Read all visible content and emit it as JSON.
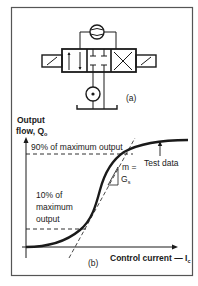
{
  "figure": {
    "panel_a": {
      "label": "(a)",
      "components": [
        "solenoid-left",
        "valve-body-3-position",
        "solenoid-right",
        "pressure-gauge",
        "pump",
        "tank"
      ]
    },
    "panel_b": {
      "label": "(b)",
      "y_axis_label_line1": "Output",
      "y_axis_label_line2": "flow, Q",
      "y_axis_label_sub": "o",
      "x_axis_label": "Control current — I",
      "x_axis_label_sub": "c",
      "annotation_90": "90% of maximum output",
      "annotation_10_line1": "10% of",
      "annotation_10_line2": "maximum",
      "annotation_10_line3": "output",
      "annotation_test_data": "Test data",
      "slope_line1": "m =",
      "slope_line2": "G",
      "slope_sub": "s"
    }
  },
  "colors": {
    "ink": "#1a1a1a",
    "frame": "#555555",
    "background": "#ffffff"
  }
}
